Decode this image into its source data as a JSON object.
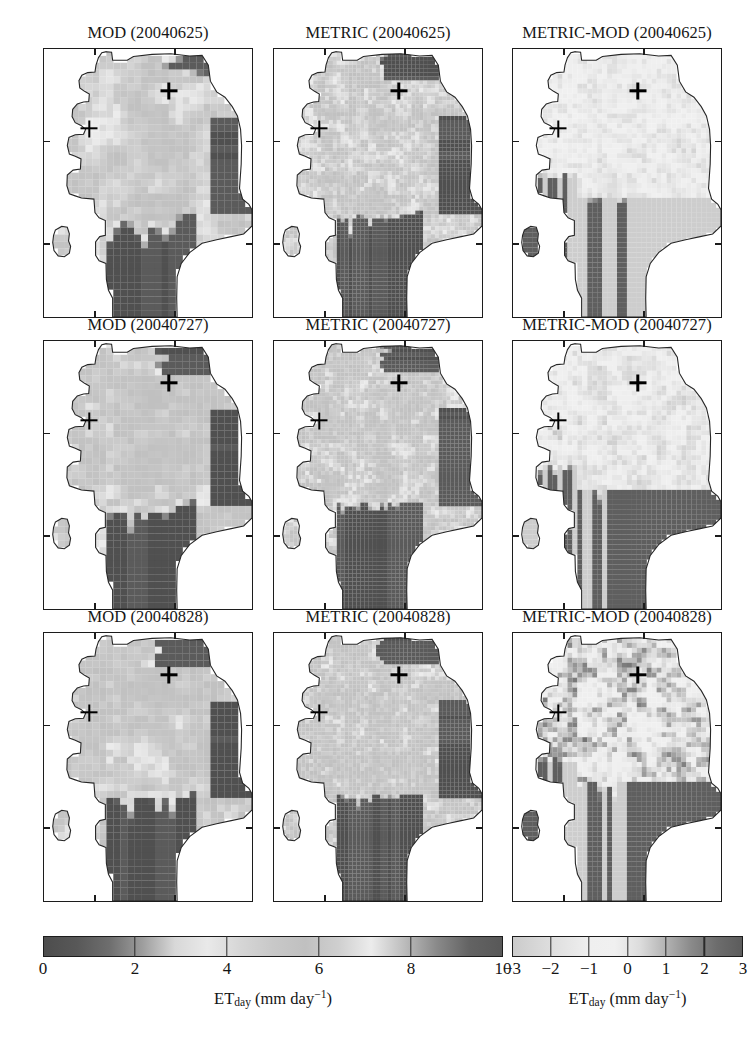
{
  "figure": {
    "width": 755,
    "height": 1052,
    "background": "#ffffff"
  },
  "chart_data": {
    "type": "heatmap",
    "title": "",
    "rows": [
      "20040625",
      "20040727",
      "20040828"
    ],
    "columns": [
      "MOD",
      "METRIC",
      "METRIC-MOD"
    ],
    "panels": [
      {
        "row": 0,
        "col": 0,
        "title": "MOD (20040625)",
        "product": "MOD",
        "date": "20040625",
        "colorbar": "et",
        "vmin": 0,
        "vmax": 10
      },
      {
        "row": 0,
        "col": 1,
        "title": "METRIC (20040625)",
        "product": "METRIC",
        "date": "20040625",
        "colorbar": "et",
        "vmin": 0,
        "vmax": 10
      },
      {
        "row": 0,
        "col": 2,
        "title": "METRIC-MOD (20040625)",
        "product": "METRIC-MOD",
        "date": "20040625",
        "colorbar": "diff",
        "vmin": -3,
        "vmax": 3
      },
      {
        "row": 1,
        "col": 0,
        "title": "MOD (20040727)",
        "product": "MOD",
        "date": "20040727",
        "colorbar": "et",
        "vmin": 0,
        "vmax": 10
      },
      {
        "row": 1,
        "col": 1,
        "title": "METRIC (20040727)",
        "product": "METRIC",
        "date": "20040727",
        "colorbar": "et",
        "vmin": 0,
        "vmax": 10
      },
      {
        "row": 1,
        "col": 2,
        "title": "METRIC-MOD (20040727)",
        "product": "METRIC-MOD",
        "date": "20040727",
        "colorbar": "diff",
        "vmin": -3,
        "vmax": 3
      },
      {
        "row": 2,
        "col": 0,
        "title": "MOD (20040828)",
        "product": "MOD",
        "date": "20040828",
        "colorbar": "et",
        "vmin": 0,
        "vmax": 10
      },
      {
        "row": 2,
        "col": 1,
        "title": "METRIC (20040828)",
        "product": "METRIC",
        "date": "20040828",
        "colorbar": "et",
        "vmin": 0,
        "vmax": 10
      },
      {
        "row": 2,
        "col": 2,
        "title": "METRIC-MOD (20040828)",
        "product": "METRIC-MOD",
        "date": "20040828",
        "colorbar": "diff",
        "vmin": -3,
        "vmax": 3
      }
    ],
    "site_markers": [
      {
        "name": "north-site",
        "x_frac": 0.595,
        "y_frac": 0.155
      },
      {
        "name": "west-site",
        "x_frac": 0.215,
        "y_frac": 0.295
      }
    ],
    "colorbars": [
      {
        "id": "et",
        "variable": "ET_day",
        "units": "mm day^-1",
        "label_main": "ET",
        "label_sub": "day",
        "label_units_pre": " (mm day",
        "label_units_sup": "−1",
        "label_units_post": ")",
        "vmin": 0,
        "vmax": 10,
        "ticks": [
          0,
          2,
          4,
          6,
          8,
          10
        ],
        "tick_labels": [
          "0",
          "2",
          "4",
          "6",
          "8",
          "10"
        ],
        "colormap": "grayscale-cyclic-dark-light-dark",
        "stops": [
          "#4d4d4d",
          "#585858",
          "#6e6e6e",
          "#9d9d9d",
          "#d8d8d8",
          "#e9e9e9",
          "#d6d6d6",
          "#c8c8c8",
          "#c0c0c0",
          "#cfcfcf",
          "#ececec",
          "#bdbdbd",
          "#8a8a8a",
          "#636363",
          "#585858"
        ]
      },
      {
        "id": "diff",
        "variable": "ET_day",
        "units": "mm day^-1",
        "label_main": "ET",
        "label_sub": "day",
        "label_units_pre": " (mm day",
        "label_units_sup": "−1",
        "label_units_post": ")",
        "vmin": -3,
        "vmax": 3,
        "ticks": [
          -3,
          -2,
          -1,
          0,
          1,
          2,
          3
        ],
        "tick_labels": [
          "−3",
          "−2",
          "−1",
          "0",
          "1",
          "2",
          "3"
        ],
        "colormap": "grayscale-light-to-dark",
        "stops": [
          "#cbcbcb",
          "#d8d8d8",
          "#e4e4e4",
          "#efefef",
          "#f0f0f0",
          "#dcdcdc",
          "#b3b3b3",
          "#8a8a8a",
          "#6d6d6d",
          "#5c5c5c"
        ]
      }
    ],
    "axes": {
      "frame": true,
      "grid": false,
      "tick_labels_shown": false,
      "x_tick_fracs": [
        0.24,
        0.62
      ],
      "y_tick_fracs": [
        0.34,
        0.72
      ]
    }
  },
  "panel_titles": {
    "r0c0": "MOD (20040625)",
    "r0c1": "METRIC (20040625)",
    "r0c2": "METRIC-MOD (20040625)",
    "r1c0": "MOD (20040727)",
    "r1c1": "METRIC (20040727)",
    "r1c2": "METRIC-MOD (20040727)",
    "r2c0": "MOD (20040828)",
    "r2c1": "METRIC (20040828)",
    "r2c2": "METRIC-MOD (20040828)"
  },
  "colorbar_left": {
    "labels": [
      "0",
      "2",
      "4",
      "6",
      "8",
      "10"
    ],
    "axis_main": "ET",
    "axis_sub": "day",
    "axis_units_pre": " (mm day",
    "axis_units_sup": "−1",
    "axis_units_post": ")"
  },
  "colorbar_right": {
    "labels": [
      "−3",
      "−2",
      "−1",
      "0",
      "1",
      "2",
      "3"
    ],
    "axis_main": "ET",
    "axis_sub": "day",
    "axis_units_pre": " (mm day",
    "axis_units_sup": "−1",
    "axis_units_post": ")"
  }
}
